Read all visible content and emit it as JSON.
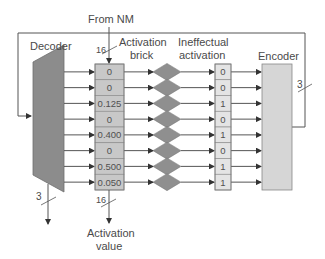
{
  "diagram": {
    "labels": {
      "from_nm": "From NM",
      "decoder": "Decoder",
      "activation_brick_line1": "Activation",
      "activation_brick_line2": "brick",
      "ineffectual_line1": "Ineffectual",
      "ineffectual_line2": "activation",
      "encoder": "Encoder",
      "activation_value_line1": "Activation",
      "activation_value_line2": "value"
    },
    "bus_widths": {
      "from_nm": "16",
      "activation_out": "16",
      "decoder_out": "3",
      "encoder_out": "3"
    },
    "activation_brick": [
      "0",
      "0",
      "0.125",
      "0",
      "0.400",
      "0",
      "0.500",
      "0.050"
    ],
    "ineffectual_flags": [
      "0",
      "0",
      "1",
      "0",
      "1",
      "0",
      "1",
      "1"
    ],
    "colors": {
      "line": "#555555",
      "decoder_fill": "#8c8c8c",
      "brick_fill": "#c8c8c8",
      "diamond_fill": "#8f8f8f",
      "flag_fill": "#e4e4e4",
      "encoder_fill": "#d6d6d6",
      "text": "#4a4a4a"
    }
  }
}
